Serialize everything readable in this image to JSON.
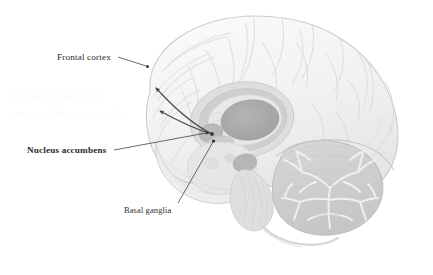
{
  "figure": {
    "background_color": "#ffffff",
    "width": 433,
    "height": 275
  },
  "labels": {
    "frontal_cortex": "Frontal cortex",
    "nucleus_accumbens": "Nucleus accumbens",
    "basal_ganglia": "Basal ganglia"
  },
  "colors": {
    "label_text": "#2b2b2b",
    "leader_line": "#3a3a3a",
    "arrow_stroke": "#4a4a4a",
    "cortex_fill": "#f3f3f3",
    "cortex_outline": "#cfcfcf",
    "sulci_line": "#d6d6d6",
    "midbrain_fill": "#e3e3e3",
    "thalamus_fill": "#a9a9a9",
    "ring_fill": "#c2c2c2",
    "nucleus_accumbens_dot": "#9e9e9e",
    "cerebellum_fill": "#d2d2d2",
    "cerebellum_arbor": "#f2f2f2",
    "brainstem_fill": "#dcdcdc",
    "pons_fill": "#c9c9c9"
  },
  "annotations": [
    {
      "name": "frontal-cortex",
      "text": "Frontal cortex",
      "bold": false,
      "label_x": 57,
      "label_y": 53,
      "leader_from_x": 118,
      "leader_from_y": 57,
      "leader_to_x": 147,
      "leader_to_y": 67,
      "has_dot": true
    },
    {
      "name": "nucleus-accumbens",
      "text": "Nucleus accumbens",
      "bold": true,
      "label_x": 27,
      "label_y": 146,
      "leader_from_x": 112,
      "leader_from_y": 150,
      "leader_to_x": 206,
      "leader_to_y": 133,
      "has_dot": true
    },
    {
      "name": "basal-ganglia",
      "text": "Basal ganglia",
      "bold": false,
      "label_x": 124,
      "label_y": 207,
      "leader_from_x": 178,
      "leader_from_y": 203,
      "leader_to_x": 213,
      "leader_to_y": 142,
      "has_dot": true
    }
  ],
  "pathway_arrows": [
    {
      "name": "accumbens-to-cortex-upper",
      "start_x": 212,
      "start_y": 134,
      "end_x": 154,
      "end_y": 86,
      "arrowhead": "at-end"
    },
    {
      "name": "accumbens-to-cortex-lower",
      "start_x": 212,
      "start_y": 134,
      "end_x": 157,
      "end_y": 109,
      "arrowhead": "at-end"
    }
  ],
  "structures": [
    {
      "name": "cerebral-cortex",
      "label": "Cerebral cortex (frontal, parietal, occipital lobes)"
    },
    {
      "name": "corpus-callosum-ring",
      "label": "Corpus callosum / limbic ring"
    },
    {
      "name": "thalamus",
      "label": "Thalamus (central oval)"
    },
    {
      "name": "nucleus-accumbens-region",
      "label": "Nucleus accumbens"
    },
    {
      "name": "basal-ganglia-region",
      "label": "Basal ganglia"
    },
    {
      "name": "cerebellum",
      "label": "Cerebellum with arbor vitae"
    },
    {
      "name": "brainstem",
      "label": "Brainstem / medulla"
    },
    {
      "name": "pons",
      "label": "Pons"
    }
  ],
  "watermark": {
    "line1": "faint background text",
    "line2": "barely visible ghost artifact"
  }
}
